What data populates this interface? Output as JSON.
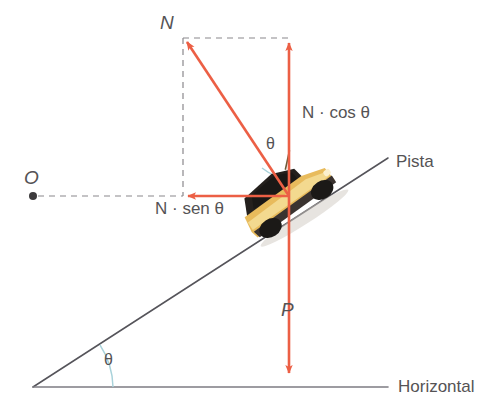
{
  "figure": {
    "type": "free-body-diagram",
    "language": "pt-BR"
  },
  "labels": {
    "normal_force": "N",
    "origin": "O",
    "normal_vertical_component": "N · cos θ",
    "normal_horizontal_component": "N · sen θ",
    "weight": "P",
    "incline": "Pista",
    "baseline": "Horizontal",
    "angle_top": "θ",
    "angle_bottom": "θ"
  },
  "colors": {
    "vector": "#ec5f45",
    "vector_light": "#f08a73",
    "line": "#55545a",
    "dash": "#8a888c",
    "text": "#555355",
    "arc": "#a8d2da",
    "car_body": "#e8bb5c",
    "car_body_light": "#f2d78c",
    "car_dark": "#24201d",
    "background": "#ffffff"
  },
  "geometry": {
    "origin_point": {
      "x": 33,
      "y": 196
    },
    "force_point": {
      "x": 289,
      "y": 196
    },
    "normal_tip": {
      "x": 183,
      "y": 38
    },
    "ncos_tip": {
      "x": 289,
      "y": 38
    },
    "nsen_tip": {
      "x": 183,
      "y": 196
    },
    "weight_tip": {
      "x": 289,
      "y": 378
    },
    "incline_start": {
      "x": 33,
      "y": 387
    },
    "incline_end": {
      "x": 388,
      "y": 158
    },
    "baseline_y": 387,
    "baseline_start_x": 33,
    "baseline_end_x": 388,
    "incline_angle_deg": 33
  }
}
